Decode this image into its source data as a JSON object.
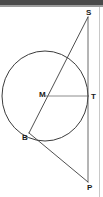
{
  "figure": {
    "type": "geometry-diagram",
    "background_color": "#ffffff",
    "stroke_color": "#3c3c3c",
    "label_color": "#1a1a1a",
    "top_band_color": "#4a4a4a",
    "right_rule_color": "#c8c8c8"
  },
  "points": {
    "S": {
      "label": "S",
      "x": 88,
      "y": 17
    },
    "T": {
      "label": "T",
      "x": 88,
      "y": 97
    },
    "M": {
      "label": "M",
      "x": 45,
      "y": 96
    },
    "B": {
      "label": "B",
      "x": 29,
      "y": 133
    },
    "P": {
      "label": "P",
      "x": 88,
      "y": 182
    }
  },
  "circle": {
    "center_x": 45,
    "center_y": 96,
    "radius_x": 43,
    "radius_y": 45,
    "name": "circle-M"
  },
  "segments": [
    {
      "name": "segment-S-T-P",
      "from": "S",
      "to": "P",
      "description": "vertical tangent line through T"
    },
    {
      "name": "segment-S-B",
      "from": "S",
      "to": "B",
      "description": "secant from S through circle to B"
    },
    {
      "name": "segment-B-P",
      "from": "B",
      "to": "P",
      "description": "tangent from B to P"
    },
    {
      "name": "segment-M-T",
      "from": "M",
      "to": "T",
      "description": "radius from center M to tangent point T"
    }
  ]
}
